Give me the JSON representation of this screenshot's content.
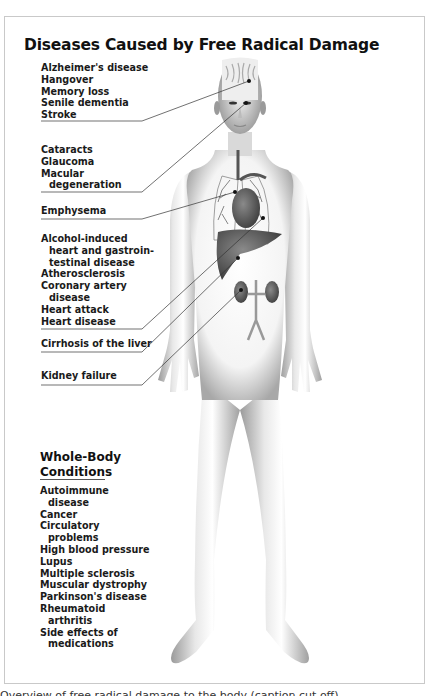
{
  "title": "Diseases Caused by Free Radical Damage",
  "groups": [
    {
      "organ": "brain",
      "items": [
        {
          "text": "Alzheimer's disease",
          "indent": false
        },
        {
          "text": "Hangover",
          "indent": false
        },
        {
          "text": "Memory loss",
          "indent": false
        },
        {
          "text": "Senile dementia",
          "indent": false
        },
        {
          "text": "Stroke",
          "indent": false
        }
      ]
    },
    {
      "organ": "eyes",
      "items": [
        {
          "text": "Cataracts",
          "indent": false
        },
        {
          "text": "Glaucoma",
          "indent": false
        },
        {
          "text": "Macular",
          "indent": false
        },
        {
          "text": "degeneration",
          "indent": true
        }
      ]
    },
    {
      "organ": "lungs",
      "items": [
        {
          "text": "Emphysema",
          "indent": false
        }
      ]
    },
    {
      "organ": "heart",
      "items": [
        {
          "text": "Alcohol-induced",
          "indent": false
        },
        {
          "text": "heart and gastroin-",
          "indent": true
        },
        {
          "text": "testinal disease",
          "indent": true
        },
        {
          "text": "Atherosclerosis",
          "indent": false
        },
        {
          "text": "Coronary artery",
          "indent": false
        },
        {
          "text": "disease",
          "indent": true
        },
        {
          "text": "Heart attack",
          "indent": false
        },
        {
          "text": "Heart disease",
          "indent": false
        }
      ]
    },
    {
      "organ": "liver",
      "items": [
        {
          "text": "Cirrhosis of the liver",
          "indent": false
        }
      ]
    },
    {
      "organ": "kidneys",
      "items": [
        {
          "text": "Kidney failure",
          "indent": false
        }
      ]
    }
  ],
  "whole_body": {
    "title_line1": "Whole-Body",
    "title_line2": "Conditions",
    "items": [
      {
        "text": "Autoimmune",
        "indent": false
      },
      {
        "text": "disease",
        "indent": true
      },
      {
        "text": "Cancer",
        "indent": false
      },
      {
        "text": "Circulatory",
        "indent": false
      },
      {
        "text": "problems",
        "indent": true
      },
      {
        "text": "High blood pressure",
        "indent": false
      },
      {
        "text": "Lupus",
        "indent": false
      },
      {
        "text": "Multiple sclerosis",
        "indent": false
      },
      {
        "text": "Muscular dystrophy",
        "indent": false
      },
      {
        "text": "Parkinson's disease",
        "indent": false
      },
      {
        "text": "Rheumatoid",
        "indent": false
      },
      {
        "text": "arthritis",
        "indent": true
      },
      {
        "text": "Side effects of",
        "indent": false
      },
      {
        "text": "medications",
        "indent": true
      }
    ]
  },
  "caption_partial": "Overview of free radical damage to the body (caption cut off)"
}
